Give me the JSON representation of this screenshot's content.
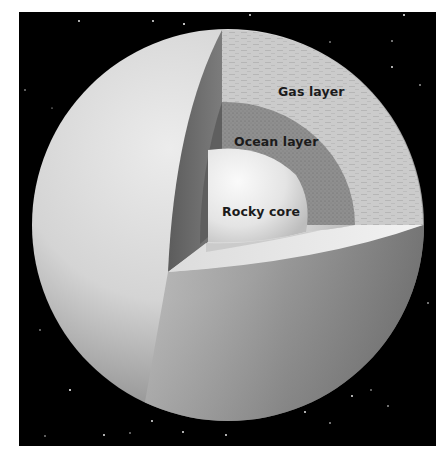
{
  "figure": {
    "labels": {
      "gas": "Gas layer",
      "ocean": "Ocean layer",
      "core": "Rocky core"
    },
    "colors": {
      "background": "#000000",
      "margin": "#ffffff",
      "label_text": "#1b1b1b",
      "gas_layer": "#c9c9c9",
      "ocean_layer": "#8e8e8e",
      "rocky_core": "#e6e6e6",
      "sphere_light": "#e2e2e2",
      "sphere_dark": "#6e6e6e"
    }
  }
}
